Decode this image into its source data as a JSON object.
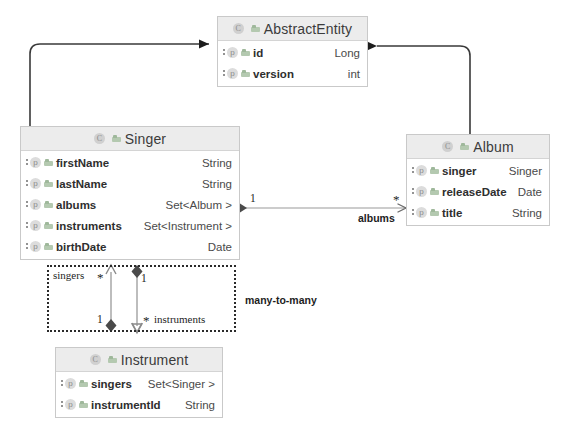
{
  "diagram": {
    "type": "uml-class-diagram",
    "background": "#ffffff",
    "accent_header": "#ececec",
    "border_color": "#c9c9c9"
  },
  "classes": [
    {
      "key": "abstract_entity",
      "name": "AbstractEntity",
      "class_icon": "C",
      "attributes": [
        {
          "name": "id",
          "type": "Long",
          "icon": "p"
        },
        {
          "name": "version",
          "type": "int",
          "icon": "p"
        }
      ]
    },
    {
      "key": "singer",
      "name": "Singer",
      "class_icon": "C",
      "attributes": [
        {
          "name": "firstName",
          "type": "String",
          "icon": "p"
        },
        {
          "name": "lastName",
          "type": "String",
          "icon": "p"
        },
        {
          "name": "albums",
          "type": "Set<Album >",
          "icon": "p"
        },
        {
          "name": "instruments",
          "type": "Set<Instrument >",
          "icon": "p"
        },
        {
          "name": "birthDate",
          "type": "Date",
          "icon": "p"
        }
      ]
    },
    {
      "key": "album",
      "name": "Album",
      "class_icon": "C",
      "attributes": [
        {
          "name": "singer",
          "type": "Singer",
          "icon": "p"
        },
        {
          "name": "releaseDate",
          "type": "Date",
          "icon": "p"
        },
        {
          "name": "title",
          "type": "String",
          "icon": "p"
        }
      ]
    },
    {
      "key": "instrument",
      "name": "Instrument",
      "class_icon": "C",
      "attributes": [
        {
          "name": "singers",
          "type": "Set<Singer >",
          "icon": "p"
        },
        {
          "name": "instrumentId",
          "type": "String",
          "icon": "p"
        }
      ]
    }
  ],
  "relationships": {
    "albums_assoc": {
      "label": "albums",
      "source_multiplicity": "1",
      "target_multiplicity": "*"
    },
    "singers_assoc": {
      "label": "singers",
      "source_multiplicity": "*",
      "target_multiplicity": "1"
    },
    "instruments_assoc": {
      "label": "instruments",
      "source_multiplicity": "1",
      "target_multiplicity": "*"
    },
    "group_annotation": "many-to-many"
  }
}
